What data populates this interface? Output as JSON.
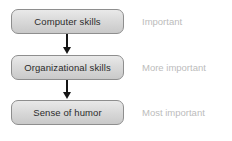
{
  "diagram": {
    "colors": {
      "box_border": "#8e8e8e",
      "box_fill_top": "#e9e9e9",
      "box_fill_bottom": "#c9c9c9",
      "box_text": "#2b2b2b",
      "arrow": "#151515",
      "caption_text": "#bcbcbc",
      "background": "#ffffff"
    },
    "nodes": [
      {
        "label": "Computer skills"
      },
      {
        "label": "Organizational skills"
      },
      {
        "label": "Sense of humor"
      }
    ],
    "arrows": [
      {
        "icon": "arrow-down-icon",
        "from": "Computer skills",
        "to": "Organizational skills"
      },
      {
        "icon": "arrow-down-icon",
        "from": "Organizational skills",
        "to": "Sense of humor"
      }
    ],
    "captions": [
      {
        "label": "Important"
      },
      {
        "label": "More important"
      },
      {
        "label": "Most important"
      }
    ]
  }
}
